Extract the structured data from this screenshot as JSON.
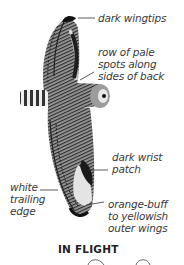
{
  "figure": {
    "caption": "IN FLIGHT",
    "colors": {
      "plumage_dark": "#2a2a2a",
      "plumage_mid": "#7a7a7a",
      "outer_wing_pale": "#e2e2e2",
      "leader_line": "#333333"
    }
  },
  "labels": [
    {
      "id": "dark-wingtips",
      "text": "dark wingtips"
    },
    {
      "id": "pale-spots",
      "text": "row of pale\nspots along\nsides of back"
    },
    {
      "id": "wrist-patch",
      "text": "dark wrist\npatch"
    },
    {
      "id": "trailing-edge",
      "text": "white\ntrailing\nedge"
    },
    {
      "id": "outer-wings",
      "text": "orange-buff\nto yellowish\nouter wings"
    }
  ]
}
